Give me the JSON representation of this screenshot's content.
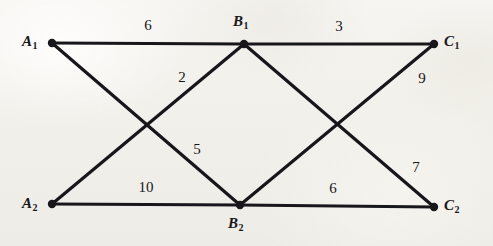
{
  "figure": {
    "type": "weighted-bipartite-graph-diagram",
    "background_color": "#f2f0ea",
    "ink_color": "#17161a",
    "width": 493,
    "height": 246
  },
  "nodes": [
    {
      "id": "A1",
      "base": "A",
      "sub": "1",
      "x": 52,
      "y": 43,
      "label_x": 22,
      "label_y": 34,
      "label_anchor": "left"
    },
    {
      "id": "B1",
      "base": "B",
      "sub": "1",
      "x": 244,
      "y": 44,
      "label_x": 233,
      "label_y": 14,
      "label_anchor": "above"
    },
    {
      "id": "C1",
      "base": "C",
      "sub": "1",
      "x": 434,
      "y": 44,
      "label_x": 444,
      "label_y": 34,
      "label_anchor": "right"
    },
    {
      "id": "A2",
      "base": "A",
      "sub": "2",
      "x": 52,
      "y": 204,
      "label_x": 22,
      "label_y": 196,
      "label_anchor": "left"
    },
    {
      "id": "B2",
      "base": "B",
      "sub": "2",
      "x": 240,
      "y": 205,
      "label_x": 228,
      "label_y": 216,
      "label_anchor": "below"
    },
    {
      "id": "C2",
      "base": "C",
      "sub": "2",
      "x": 434,
      "y": 207,
      "label_x": 444,
      "label_y": 198,
      "label_anchor": "right"
    }
  ],
  "edges": [
    {
      "id": "A1-B1",
      "from": "A1",
      "to": "B1",
      "weight": "6",
      "label_x": 148,
      "label_y": 25
    },
    {
      "id": "B1-C1",
      "from": "B1",
      "to": "C1",
      "weight": "3",
      "label_x": 339,
      "label_y": 26
    },
    {
      "id": "A2-B1",
      "from": "A2",
      "to": "B1",
      "weight": "2",
      "label_x": 182,
      "label_y": 77
    },
    {
      "id": "B1-C2",
      "from": "B1",
      "to": "C2",
      "weight": "9",
      "label_x": 422,
      "label_y": 78
    },
    {
      "id": "A1-B2",
      "from": "A1",
      "to": "B2",
      "weight": "5",
      "label_x": 197,
      "label_y": 149
    },
    {
      "id": "B2-C1",
      "from": "B2",
      "to": "C1",
      "weight": "7",
      "label_x": 416,
      "label_y": 167
    },
    {
      "id": "A2-B2",
      "from": "A2",
      "to": "B2",
      "weight": "10",
      "label_x": 146,
      "label_y": 187
    },
    {
      "id": "B2-C2",
      "from": "B2",
      "to": "C2",
      "weight": "6",
      "label_x": 333,
      "label_y": 188
    }
  ]
}
